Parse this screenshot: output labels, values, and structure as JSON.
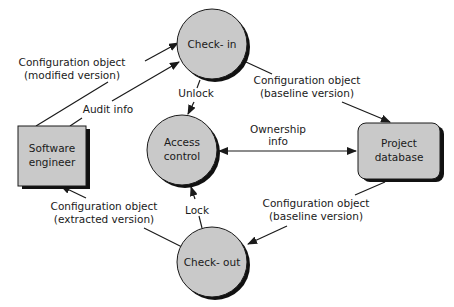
{
  "colors": {
    "node_fill": "#c9c9c9",
    "node_shadow": "#111111",
    "stroke": "#1a1a1a",
    "background": "#ffffff"
  },
  "nodes": {
    "check_in": {
      "label": "Check- in",
      "shape": "circle"
    },
    "access_control": {
      "label_line1": "Access",
      "label_line2": "control",
      "shape": "circle"
    },
    "check_out": {
      "label": "Check- out",
      "shape": "circle"
    },
    "software_engineer": {
      "label_line1": "Software",
      "label_line2": "engineer",
      "shape": "rectangle"
    },
    "project_database": {
      "label_line1": "Project",
      "label_line2": "database",
      "shape": "rounded-rectangle"
    }
  },
  "edges": {
    "engineer_to_checkin_config": {
      "line1": "Configuration object",
      "line2": "(modified version)"
    },
    "engineer_to_checkin_audit": {
      "label": "Audit info"
    },
    "checkin_to_database": {
      "line1": "Configuration object",
      "line2": "(baseline version)"
    },
    "checkin_to_access": {
      "label": "Unlock"
    },
    "ownership": {
      "line1": "Ownership",
      "line2": "info"
    },
    "checkout_to_access": {
      "label": "Lock"
    },
    "database_to_checkout": {
      "line1": "Configuration object",
      "line2": "(baseline version)"
    },
    "checkout_to_engineer": {
      "line1": "Configuration object",
      "line2": "(extracted version)"
    }
  }
}
